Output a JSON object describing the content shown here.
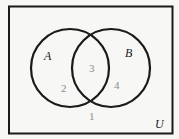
{
  "diagram": {
    "type": "venn",
    "universe_label": "U",
    "sets": [
      {
        "name": "A"
      },
      {
        "name": "B"
      }
    ],
    "regions": {
      "outside": "1",
      "a_only": "2",
      "a_and_b": "3",
      "b_only": "4"
    },
    "colors": {
      "stroke": "#1a1a1a",
      "background": "#f7f7f5",
      "region_text": "#8a8a8a"
    }
  }
}
